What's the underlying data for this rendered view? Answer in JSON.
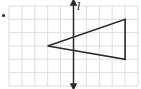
{
  "figure": {
    "type": "coordinate-grid-diagram",
    "bullet": true,
    "grid": {
      "columns": 10,
      "rows": 6,
      "origin_px": [
        9,
        6
      ],
      "cell_w_px": 12.9,
      "cell_h_px": 13.33,
      "line_color": "#d9d9d9"
    },
    "line": {
      "label": "l",
      "orientation": "vertical",
      "grid_x": 5,
      "arrows": "both",
      "color": "#2a2a2a"
    },
    "triangle": {
      "vertices_grid": [
        [
          3,
          3
        ],
        [
          9,
          1
        ],
        [
          9,
          4
        ]
      ],
      "stroke_color": "#2a2a2a",
      "fill": "none"
    }
  }
}
